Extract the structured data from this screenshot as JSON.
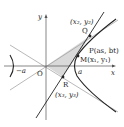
{
  "diagram": {
    "axes": {
      "x_label": "x",
      "y_label": "y",
      "origin_label": "O"
    },
    "ticks": {
      "neg_a": "−a",
      "pos_a": "a"
    },
    "points": {
      "Q": {
        "label": "Q",
        "coords": "(x₂, y₂)"
      },
      "P": {
        "label": "P(as, bt)"
      },
      "M": {
        "label": "M(x₁, y₁)"
      },
      "R": {
        "label": "R",
        "coords": "(x₃, y₃)"
      }
    },
    "colors": {
      "shade": "#d9d9d9",
      "curve": "#222222",
      "asymptote": "#999999",
      "axis": "#555555"
    }
  }
}
